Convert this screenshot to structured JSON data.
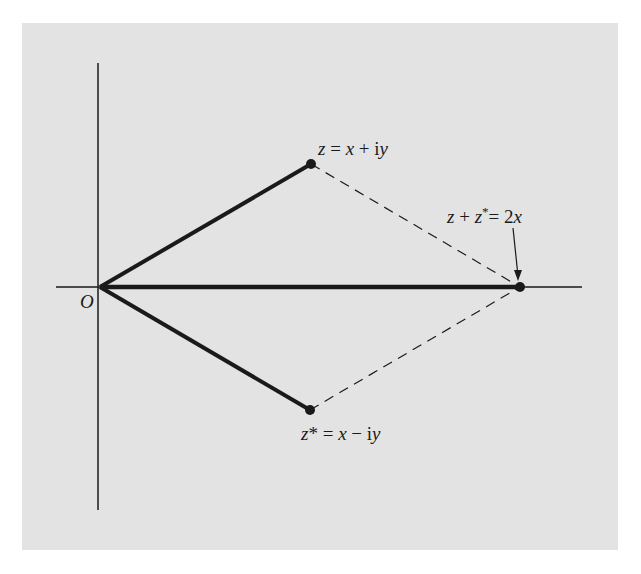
{
  "diagram": {
    "title": "",
    "origin_label": "O",
    "point_z": {
      "label": "z = x + iy",
      "parts": [
        "z",
        " = ",
        "x",
        " + i",
        "y"
      ]
    },
    "point_zstar": {
      "label": "z* = x − iy",
      "parts": [
        "z",
        "*",
        " = ",
        "x",
        " − i",
        "y"
      ]
    },
    "point_sum": {
      "label": "z + z* = 2x",
      "parts": [
        "z",
        " + ",
        "z",
        "*",
        "= ",
        "2",
        "x"
      ]
    },
    "colors": {
      "panel": "#e3e3e3",
      "ink": "#1a1a1a",
      "background": "#ffffff"
    }
  }
}
